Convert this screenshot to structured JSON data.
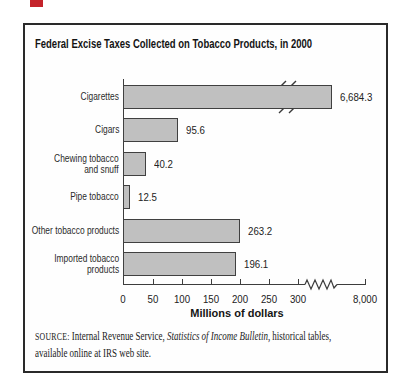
{
  "page": {
    "artifact_color": "#c4232a"
  },
  "chart": {
    "title": "Federal Excise Taxes Collected on Tobacco Products, in 2000",
    "source": {
      "label": "SOURCE:",
      "part1": "Internal Revenue Service, ",
      "italic": "Statistics of Income Bulletin",
      "part2": ", historical tables,",
      "line2": "available online at IRS web site."
    }
  },
  "chart_data": {
    "type": "bar",
    "orientation": "horizontal",
    "title": "Federal Excise Taxes Collected on Tobacco Products, in 2000",
    "categories": [
      "Cigarettes",
      "Cigars",
      "Chewing tobacco and snuff",
      "Pipe tobacco",
      "Other tobacco products",
      "Imported tobacco products"
    ],
    "category_display_lines": [
      [
        "Cigarettes"
      ],
      [
        "Cigars"
      ],
      [
        "Chewing tobacco",
        "and snuff"
      ],
      [
        "Pipe tobacco"
      ],
      [
        "Other tobacco products"
      ],
      [
        "Imported tobacco",
        "products"
      ]
    ],
    "values": [
      6684.3,
      95.6,
      40.2,
      12.5,
      263.2,
      196.1
    ],
    "value_labels": [
      "6,684.3",
      "95.6",
      "40.2",
      "12.5",
      "263.2",
      "196.1"
    ],
    "xlabel": "Millions of dollars",
    "x_tick_labels": [
      "0",
      "50",
      "100",
      "150",
      "200",
      "250",
      "300",
      "8,000"
    ],
    "axis_break_between": [
      "300",
      "8,000"
    ],
    "broken_bar": "Cigarettes",
    "xlim_shown": [
      0,
      300
    ],
    "grid": false,
    "bar_color": "#c0c0c0",
    "bar_border_color": "#404040",
    "layout": {
      "axis_x_px": 98,
      "baseline_y_px": 259,
      "bar_height_px": 24,
      "bar_top_px": [
        60,
        93,
        127,
        160,
        194,
        227
      ],
      "bar_width_px": [
        209,
        55,
        23,
        7,
        117,
        113
      ],
      "x_tick_px": [
        98,
        128,
        157,
        186,
        215,
        244,
        273,
        340
      ],
      "label_col_width_px": 94
    }
  }
}
